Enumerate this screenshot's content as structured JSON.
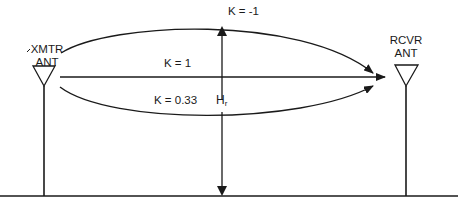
{
  "diagram": {
    "type": "radio propagation path diagram",
    "transmitter": {
      "label_line1": "XMTR",
      "label_line2": "ANT"
    },
    "receiver": {
      "label_line1": "RCVR",
      "label_line2": "ANT"
    },
    "paths": [
      {
        "k_label": "K = -1",
        "shape": "upward arc"
      },
      {
        "k_label": "K = 1",
        "shape": "straight line"
      },
      {
        "k_label": "K = 0.33",
        "shape": "downward arc"
      }
    ],
    "height_marker": {
      "label_main": "H",
      "label_sub": "r"
    },
    "colors": {
      "stroke": "#1a1a1a",
      "background": "#ffffff"
    }
  }
}
